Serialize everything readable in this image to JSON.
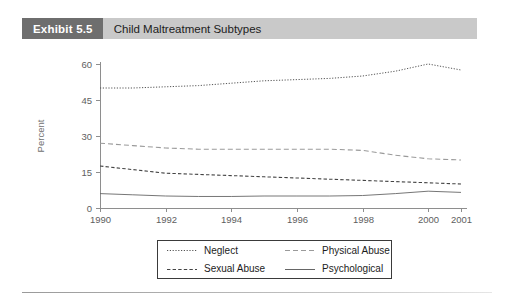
{
  "exhibit": {
    "badge": "Exhibit 5.5",
    "title": "Child Maltreatment Subtypes"
  },
  "legend": {
    "items": [
      {
        "label": "Neglect",
        "style": "dotted",
        "color": "#555555"
      },
      {
        "label": "Physical Abuse",
        "style": "dashed-light",
        "color": "#9a9a9a"
      },
      {
        "label": "Sexual Abuse",
        "style": "dashed",
        "color": "#444444"
      },
      {
        "label": "Psychological",
        "style": "solid",
        "color": "#666666"
      }
    ]
  },
  "chart_data": {
    "type": "line",
    "title": "Child Maltreatment Subtypes",
    "xlabel": "",
    "ylabel": "Percent",
    "x": [
      1990,
      1991,
      1992,
      1993,
      1994,
      1995,
      1996,
      1997,
      1998,
      1999,
      2000,
      2001
    ],
    "tick_labels": [
      "1990",
      "1992",
      "1994",
      "1996",
      "1998",
      "2000",
      "2001"
    ],
    "tick_values": [
      1990,
      1992,
      1994,
      1996,
      1998,
      2000,
      2001
    ],
    "ylim": [
      0,
      60
    ],
    "yticks": [
      0,
      15,
      30,
      45,
      60
    ],
    "ytick_labels": [
      "0",
      "15",
      "30",
      "45",
      "60"
    ],
    "xlim": [
      1990,
      2001
    ],
    "grid": false,
    "legend_position": "below",
    "series": [
      {
        "name": "Neglect",
        "style": "dotted",
        "color": "#555555",
        "values": [
          50,
          50,
          50.5,
          51,
          52,
          53,
          53.5,
          54,
          55,
          57,
          60,
          57.5
        ]
      },
      {
        "name": "Physical Abuse",
        "style": "dashed-light",
        "color": "#9a9a9a",
        "values": [
          27,
          26,
          25,
          24.5,
          24.5,
          24.5,
          24.5,
          24.5,
          24,
          22,
          20.5,
          20
        ]
      },
      {
        "name": "Sexual Abuse",
        "style": "dashed",
        "color": "#444444",
        "values": [
          17.5,
          16,
          14.5,
          14,
          13.5,
          13,
          12.5,
          12,
          11.5,
          11,
          10.5,
          10
        ]
      },
      {
        "name": "Psychological",
        "style": "solid",
        "color": "#666666",
        "values": [
          6,
          5.5,
          5,
          4.8,
          4.8,
          5,
          5,
          5,
          5.2,
          6,
          7,
          6.5
        ]
      }
    ]
  }
}
